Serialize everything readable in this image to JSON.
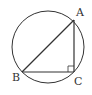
{
  "diagram": {
    "type": "geometry",
    "circle": {
      "cx": 48,
      "cy": 47,
      "r": 36
    },
    "points": {
      "A": {
        "x": 74,
        "y": 20,
        "label": "A"
      },
      "B": {
        "x": 22,
        "y": 72,
        "label": "B"
      },
      "C": {
        "x": 74,
        "y": 72,
        "label": "C"
      }
    },
    "segments": [
      [
        "A",
        "B"
      ],
      [
        "B",
        "C"
      ],
      [
        "C",
        "A"
      ]
    ],
    "right_angle_at": "C",
    "colors": {
      "stroke": "#333333",
      "background": "#ffffff"
    }
  }
}
